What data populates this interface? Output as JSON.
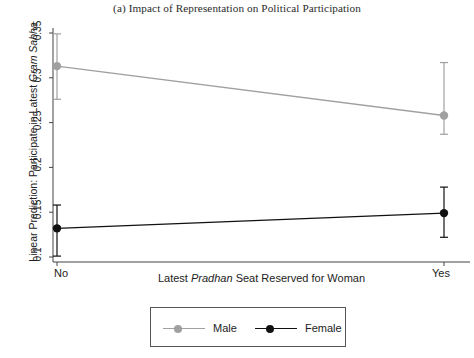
{
  "chart_data": {
    "type": "line",
    "title": "(a) Impact of Representation on Political Participation",
    "xlabel_prefix": "Latest ",
    "xlabel_italic": "Pradhan",
    "xlabel_suffix": " Seat Reserved for Woman",
    "ylabel_prefix": "Linear Prediction: Participate in Latest ",
    "ylabel_italic": "Gram Sabha",
    "ylabel_suffix": "",
    "categories": [
      "No",
      "Yes"
    ],
    "xtick_labels": [
      "No",
      "Yes"
    ],
    "ytick_labels": [
      "0.1",
      "0.15",
      "0.2",
      "0.25",
      "0.3",
      "0.35"
    ],
    "ytick_values": [
      0.1,
      0.15,
      0.2,
      0.25,
      0.3,
      0.35
    ],
    "ylim": [
      0.092,
      0.362
    ],
    "grid": false,
    "legend_position": "bottom-center",
    "series": [
      {
        "name": "Male",
        "color": "#a0a0a0",
        "marker": "circle",
        "values": [
          0.313,
          0.258
        ],
        "ci_low": [
          0.276,
          0.237
        ],
        "ci_high": [
          0.349,
          0.317
        ]
      },
      {
        "name": "Female",
        "color": "#111111",
        "marker": "circle",
        "values": [
          0.132,
          0.149
        ],
        "ci_low": [
          0.101,
          0.122
        ],
        "ci_high": [
          0.158,
          0.178
        ]
      }
    ]
  },
  "legend": {
    "entries": [
      {
        "label": "Male",
        "color": "#a0a0a0"
      },
      {
        "label": "Female",
        "color": "#111111"
      }
    ]
  }
}
